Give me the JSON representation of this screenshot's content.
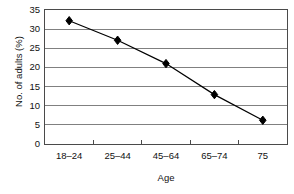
{
  "chart_data": {
    "type": "line",
    "title": "",
    "subtitle": "",
    "xlabel": "Age",
    "ylabel": "No. of adults (%)",
    "categories": [
      "18–24",
      "25–44",
      "45–64",
      "65–74",
      "75"
    ],
    "values": [
      32.2,
      27.1,
      21.0,
      12.9,
      6.2
    ],
    "series": [
      {
        "name": "No. of adults (%)",
        "values": [
          32.2,
          27.1,
          21.0,
          12.9,
          6.2
        ],
        "color": "#000000",
        "marker": "diamond",
        "marker_color": "#000000"
      }
    ],
    "ylim": [
      0,
      35
    ],
    "yticks": [
      0,
      5,
      10,
      15,
      20,
      25,
      30,
      35
    ],
    "ytick_labels": [
      "0",
      "5",
      "10",
      "15",
      "20",
      "25",
      "30",
      "35"
    ],
    "grid": "horizontal",
    "gridline_color": "#808080",
    "legend": "none",
    "plot_border_color": "#4a4a4a",
    "background": "#ffffff"
  }
}
